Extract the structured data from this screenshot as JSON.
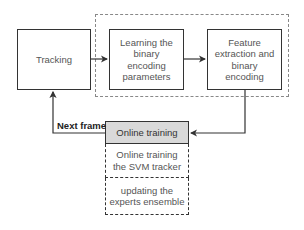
{
  "diagram": {
    "group_label": "",
    "nodes": {
      "tracking": "Tracking",
      "learning": "Learning the binary encoding parameters",
      "feature": "Feature extraction and binary encoding",
      "online_training": "Online training",
      "svm": "Online training the SVM tracker",
      "experts": "updating the experts ensemble"
    },
    "edges": [
      {
        "from": "tracking",
        "to": "learning",
        "label": ""
      },
      {
        "from": "learning",
        "to": "feature",
        "label": ""
      },
      {
        "from": "feature",
        "to": "online_training",
        "label": ""
      },
      {
        "from": "online_training",
        "to": "tracking",
        "label": "Next frame"
      }
    ],
    "edge_labels": {
      "next_frame": "Next frame"
    },
    "colors": {
      "header_fill": "#d9d9d9",
      "stroke": "#333333",
      "group_dash": "#888888"
    }
  }
}
